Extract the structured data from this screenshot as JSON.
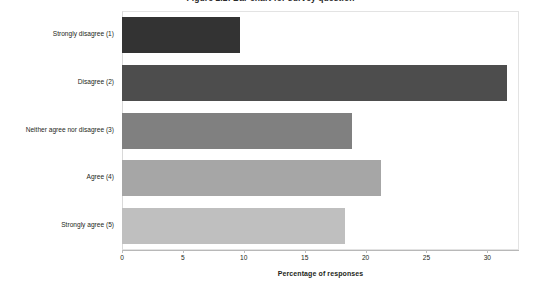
{
  "chart_data": {
    "type": "bar",
    "orientation": "horizontal",
    "title": "Figure 2.2: Bar chart for survey question",
    "title_clipped": true,
    "xlabel": "Percentage of responses",
    "ylabel": "",
    "categories": [
      "Strongly disagree (1)",
      "Disagree (2)",
      "Neither agree nor disagree (3)",
      "Agree (4)",
      "Strongly agree (5)"
    ],
    "values": [
      9.7,
      31.6,
      18.9,
      21.3,
      18.3
    ],
    "xlim": [
      0,
      32.6
    ],
    "xticks": [
      0,
      5,
      10,
      15,
      20,
      25,
      30
    ],
    "xtick_labels": [
      "0",
      "5",
      "10",
      "15",
      "20",
      "25",
      "30"
    ],
    "grid": false,
    "legend": false,
    "bar_colors": [
      "#333333",
      "#4d4d4d",
      "#808080",
      "#a6a6a6",
      "#bfbfbf"
    ],
    "plot_border_color": "#e3e3e3",
    "axis_color": "#b8b8b8",
    "text_color": "#231f20"
  }
}
